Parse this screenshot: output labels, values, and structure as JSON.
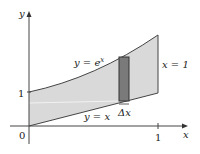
{
  "diagram": {
    "axes": {
      "x_label": "x",
      "y_label": "y",
      "origin_label": "0",
      "x_tick_label": "1",
      "y_tick_label": "1"
    },
    "curves": {
      "upper": {
        "label_prefix": "y = e",
        "label_exp": "x"
      },
      "lower": {
        "label": "y = x"
      },
      "right_boundary": {
        "label": "x = 1"
      }
    },
    "strip": {
      "label": "Δx"
    },
    "colors": {
      "region_fill": "#d9d9d9",
      "strip_fill": "#7a7a7a",
      "line": "#333333"
    }
  }
}
